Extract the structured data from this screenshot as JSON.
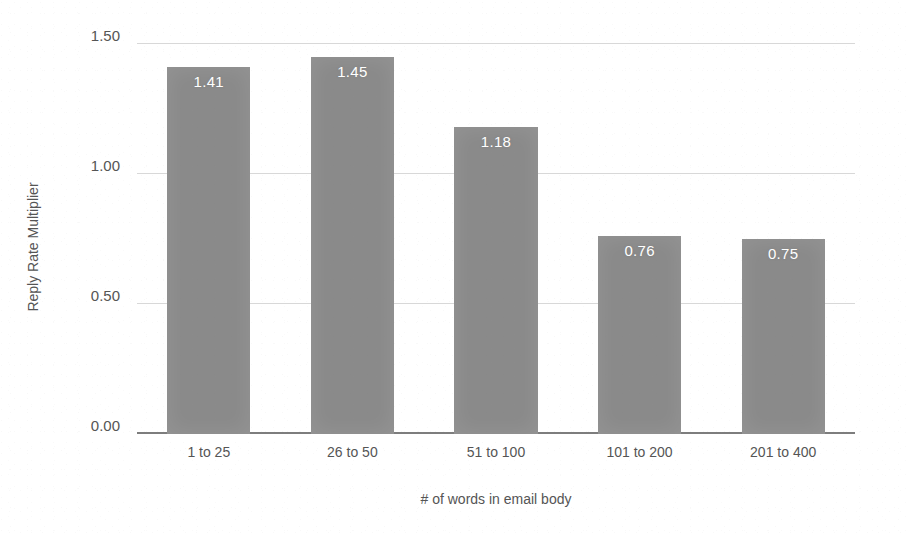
{
  "chart_data": {
    "type": "bar",
    "title": "",
    "subtitle": "",
    "categories": [
      "1 to 25",
      "26 to 50",
      "51 to 100",
      "101 to 200",
      "201 to 400"
    ],
    "values": [
      1.41,
      1.45,
      1.18,
      0.76,
      0.75
    ],
    "value_labels": [
      "1.41",
      "1.45",
      "1.18",
      "0.76",
      "0.75"
    ],
    "xlabel": "# of words in email body",
    "ylabel": "Reply Rate Multiplier",
    "ylim": [
      0,
      1.5
    ],
    "yticks": [
      0,
      0.5,
      1.0,
      1.5
    ],
    "ytick_labels": [
      "0.00",
      "0.50",
      "1.00",
      "1.50"
    ],
    "grid": true,
    "grid_axis": "y",
    "legend": false,
    "legend_position": "none",
    "bar_color": "#8a8a8a",
    "value_label_color": "#ffffff",
    "gridline_color": "#d8d8d8",
    "axis_line_color": "#7d7d7d",
    "background_color": "#ffffff",
    "text_color": "#555555"
  }
}
